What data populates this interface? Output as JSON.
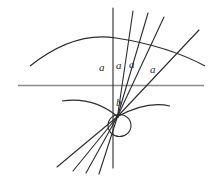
{
  "figure": {
    "width": 220,
    "height": 181,
    "background_color": "#ffffff",
    "ink_color": "#2b2b2b",
    "axis_color": "#8a8a8a"
  },
  "labels": [
    {
      "id": "a1",
      "text": "a",
      "x": 99,
      "y": 62
    },
    {
      "id": "a2",
      "text": "a",
      "x": 116,
      "y": 60
    },
    {
      "id": "a3",
      "text": "a",
      "x": 129,
      "y": 59
    },
    {
      "id": "a4",
      "text": "a",
      "x": 150,
      "y": 64
    },
    {
      "id": "b1",
      "text": "b",
      "x": 116,
      "y": 97
    }
  ],
  "geometry": {
    "vertex": {
      "x": 117.5,
      "y": 116.5
    },
    "horizontal_axis": {
      "x1": 18,
      "y1": 85.5,
      "x2": 204,
      "y2": 85.5
    },
    "circle": {
      "cx": 119.5,
      "cy": 125.5,
      "rx": 11.5,
      "ry": 11
    },
    "upper_arc": "M 30 66 Q 75 32 116 38 Q 168 46 205 66",
    "lower_arc": "M 62 101 Q 94 97 117.5 116.5 Q 146 101 170 106",
    "rays": [
      {
        "id": "ray-vertical",
        "x1": 113,
        "y1": 8,
        "x2": 113,
        "y2": 168
      },
      {
        "id": "ray-up-2",
        "x1": 133,
        "y1": 11,
        "x2": 117.5,
        "y2": 116.5
      },
      {
        "id": "ray-up-3",
        "x1": 148,
        "y1": 13,
        "x2": 117.5,
        "y2": 116.5
      },
      {
        "id": "ray-up-4",
        "x1": 164,
        "y1": 17,
        "x2": 117.5,
        "y2": 116.5
      },
      {
        "id": "ray-up-5",
        "x1": 199,
        "y1": 30,
        "x2": 117.5,
        "y2": 116.5
      },
      {
        "id": "ray-down-1",
        "x1": 117.5,
        "y1": 116.5,
        "x2": 57,
        "y2": 167
      },
      {
        "id": "ray-down-2",
        "x1": 117.5,
        "y1": 116.5,
        "x2": 73,
        "y2": 171
      },
      {
        "id": "ray-down-3",
        "x1": 117.5,
        "y1": 116.5,
        "x2": 86,
        "y2": 173
      },
      {
        "id": "ray-down-4",
        "x1": 117.5,
        "y1": 116.5,
        "x2": 99,
        "y2": 174
      }
    ]
  }
}
